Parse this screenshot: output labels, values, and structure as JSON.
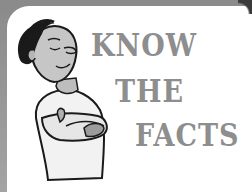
{
  "illustration": {
    "description": "cartoon man with eyes closed, smiling, arms crossed",
    "frame_color": "#9a9a9a",
    "text_color": "#8e8e8e"
  },
  "headline": {
    "lines": [
      "KNOW",
      "THE",
      "FACTS"
    ]
  }
}
